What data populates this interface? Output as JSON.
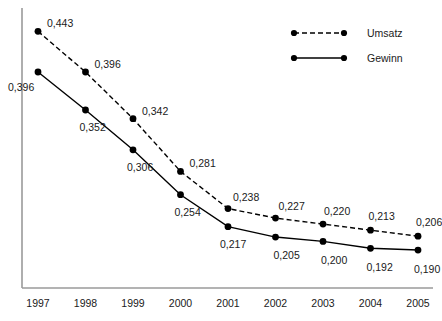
{
  "chart_data": {
    "type": "line",
    "title": "",
    "subtitle": "",
    "xlabel": "",
    "ylabel": "",
    "categories": [
      "1997",
      "1998",
      "1999",
      "2000",
      "2001",
      "2002",
      "2003",
      "2004",
      "2005"
    ],
    "series": [
      {
        "name": "Umsatz",
        "style": "dashed",
        "color": "#000000",
        "values": [
          0.443,
          0.396,
          0.342,
          0.281,
          0.238,
          0.227,
          0.22,
          0.213,
          0.206
        ],
        "labels": [
          "0,443",
          "0,396",
          "0,342",
          "0,281",
          "0,238",
          "0,227",
          "0,220",
          "0,213",
          "0,206"
        ]
      },
      {
        "name": "Gewinn",
        "style": "solid",
        "color": "#000000",
        "values": [
          0.396,
          0.352,
          0.306,
          0.254,
          0.217,
          0.205,
          0.2,
          0.192,
          0.19
        ],
        "labels": [
          "0,396",
          "0,352",
          "0,306",
          "0,254",
          "0,217",
          "0,205",
          "0,200",
          "0,192",
          "0,190"
        ]
      }
    ],
    "ylim": [
      0.175,
      0.455
    ],
    "grid": false,
    "y_axis_ticks_visible": false,
    "legend_position": "top-right"
  },
  "legend": {
    "entries": [
      {
        "label": "Umsatz"
      },
      {
        "label": "Gewinn"
      }
    ]
  },
  "axis": {
    "color": "#999999"
  }
}
